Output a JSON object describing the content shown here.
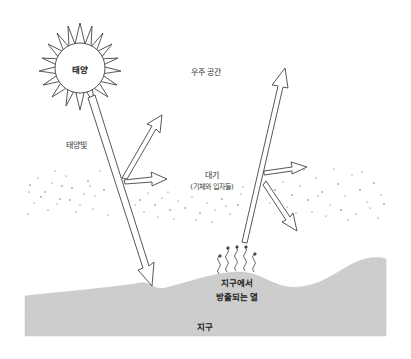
{
  "diagram": {
    "title": "",
    "labels": {
      "sun": "태양",
      "space": "우주 공간",
      "sunlight": "태양빛",
      "atmosphere": "대기",
      "atmosphere_note": "(기체와 입자들)",
      "earth_heat_line1": "지구에서",
      "earth_heat_line2": "방출되는 열",
      "earth": "지구"
    },
    "colors": {
      "line": "#444444",
      "earth_fill": "#cfcfcf",
      "dots": "#555555",
      "background": "#ffffff"
    }
  }
}
